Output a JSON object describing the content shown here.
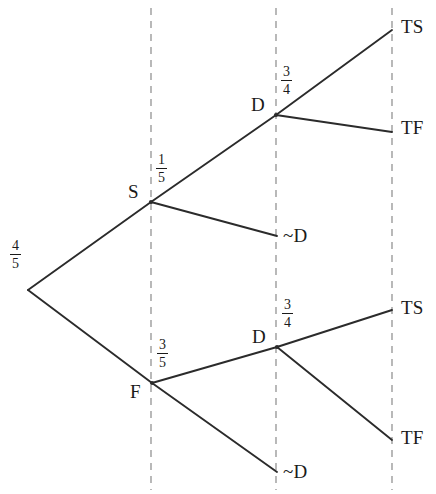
{
  "diagram": {
    "type": "probability-tree",
    "width": 436,
    "height": 494,
    "background_color": "#ffffff",
    "line_color": "#2b2b2b",
    "divider_color": "#8a8a8a",
    "stage_dividers_x": [
      151,
      276,
      392
    ]
  },
  "nodes": {
    "root": {
      "x": 28,
      "y": 290
    },
    "s": {
      "label": "S",
      "x": 151,
      "y": 202,
      "label_x": 128,
      "label_y": 182
    },
    "f": {
      "label": "F",
      "x": 152,
      "y": 383,
      "label_x": 130,
      "label_y": 382
    },
    "d_upper": {
      "label": "D",
      "x": 276,
      "y": 115,
      "label_x": 251,
      "label_y": 95
    },
    "d_lower": {
      "label": "D",
      "x": 277,
      "y": 347,
      "label_x": 252,
      "label_y": 327
    },
    "notd_upper": {
      "label": "~D",
      "x": 277,
      "y": 236,
      "label_x": 283,
      "label_y": 226
    },
    "notd_lower": {
      "label": "~D",
      "x": 277,
      "y": 472,
      "label_x": 283,
      "label_y": 462
    },
    "ts_upper": {
      "label": "TS",
      "x": 392,
      "y": 30,
      "label_x": 401,
      "label_y": 17
    },
    "tf_upper": {
      "label": "TF",
      "x": 392,
      "y": 132,
      "label_x": 401,
      "label_y": 118
    },
    "ts_lower": {
      "label": "TS",
      "x": 392,
      "y": 310,
      "label_x": 401,
      "label_y": 298
    },
    "tf_lower": {
      "label": "TF",
      "x": 392,
      "y": 440,
      "label_x": 401,
      "label_y": 428
    }
  },
  "probabilities": {
    "root_to_s": {
      "numerator": "1",
      "denominator": "5",
      "text": "1/5",
      "x": 156,
      "y": 152
    },
    "root_to_f": {
      "numerator": "4",
      "denominator": "5",
      "text": "4/5",
      "x": 10,
      "y": 238
    },
    "s_to_d": {
      "numerator": "3",
      "denominator": "4",
      "text": "3/4",
      "x": 281,
      "y": 64
    },
    "f_to_d": {
      "numerator": "3",
      "denominator": "4",
      "text": "3/4",
      "x": 282,
      "y": 297
    },
    "f_to_notd": {
      "numerator": "3",
      "denominator": "5",
      "text": "3/5",
      "x": 157,
      "y": 337
    }
  },
  "edges": [
    {
      "name": "root-to-s",
      "from": "root",
      "to": "s"
    },
    {
      "name": "root-to-f",
      "from": "root",
      "to": "f"
    },
    {
      "name": "s-to-d",
      "from": "s",
      "to": "d_upper"
    },
    {
      "name": "s-to-notd",
      "from": "s",
      "to": "notd_upper"
    },
    {
      "name": "d-upper-to-ts",
      "from": "d_upper",
      "to": "ts_upper"
    },
    {
      "name": "d-upper-to-tf",
      "from": "d_upper",
      "to": "tf_upper"
    },
    {
      "name": "f-to-d",
      "from": "f",
      "to": "d_lower"
    },
    {
      "name": "f-to-notd",
      "from": "f",
      "to": "notd_lower"
    },
    {
      "name": "d-lower-to-ts",
      "from": "d_lower",
      "to": "ts_lower"
    },
    {
      "name": "d-lower-to-tf",
      "from": "d_lower",
      "to": "tf_lower"
    }
  ]
}
